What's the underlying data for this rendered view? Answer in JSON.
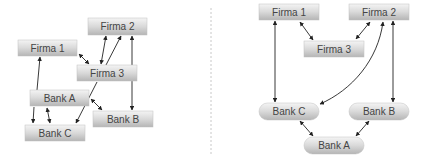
{
  "diagrams": [
    {
      "id": "left",
      "nodes": [
        {
          "key": "firma2",
          "label": "Firma 2",
          "x": 88,
          "y": 18,
          "w": 59,
          "h": 17,
          "shape": "rect"
        },
        {
          "key": "firma1",
          "label": "Firma 1",
          "x": 18,
          "y": 40,
          "w": 59,
          "h": 16,
          "shape": "rect"
        },
        {
          "key": "firma3",
          "label": "Firma 3",
          "x": 77,
          "y": 65,
          "w": 60,
          "h": 16,
          "shape": "rect"
        },
        {
          "key": "banka",
          "label": "Bank A",
          "x": 30,
          "y": 90,
          "w": 59,
          "h": 16,
          "shape": "rect"
        },
        {
          "key": "bankb",
          "label": "Bank B",
          "x": 93,
          "y": 111,
          "w": 60,
          "h": 16,
          "shape": "rect"
        },
        {
          "key": "bankc",
          "label": "Bank C",
          "x": 25,
          "y": 125,
          "w": 60,
          "h": 16,
          "shape": "rect"
        }
      ]
    },
    {
      "id": "right",
      "nodes": [
        {
          "key": "firma1",
          "label": "Firma 1",
          "x": 259,
          "y": 4,
          "w": 60,
          "h": 16,
          "shape": "rect"
        },
        {
          "key": "firma2",
          "label": "Firma 2",
          "x": 349,
          "y": 4,
          "w": 60,
          "h": 16,
          "shape": "rect"
        },
        {
          "key": "firma3",
          "label": "Firma 3",
          "x": 304,
          "y": 41,
          "w": 60,
          "h": 16,
          "shape": "rect"
        },
        {
          "key": "bankc",
          "label": "Bank C",
          "x": 259,
          "y": 103,
          "w": 60,
          "h": 17,
          "shape": "pill"
        },
        {
          "key": "bankb",
          "label": "Bank B",
          "x": 349,
          "y": 103,
          "w": 60,
          "h": 17,
          "shape": "pill"
        },
        {
          "key": "banka",
          "label": "Bank A",
          "x": 304,
          "y": 137,
          "w": 60,
          "h": 17,
          "shape": "pill"
        }
      ]
    }
  ]
}
